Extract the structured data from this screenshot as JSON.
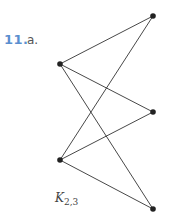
{
  "problem": {
    "number": "11.",
    "part": "a.",
    "number_color": "#5b8fcf"
  },
  "graph": {
    "name": "K",
    "subscript": "2,3",
    "left_nodes": [
      {
        "id": "L1",
        "x": 60,
        "y": 64
      },
      {
        "id": "L2",
        "x": 60,
        "y": 160
      }
    ],
    "right_nodes": [
      {
        "id": "R1",
        "x": 153,
        "y": 16
      },
      {
        "id": "R2",
        "x": 153,
        "y": 112
      },
      {
        "id": "R3",
        "x": 153,
        "y": 209
      }
    ],
    "edges": [
      [
        "L1",
        "R1"
      ],
      [
        "L1",
        "R2"
      ],
      [
        "L1",
        "R3"
      ],
      [
        "L2",
        "R1"
      ],
      [
        "L2",
        "R2"
      ],
      [
        "L2",
        "R3"
      ]
    ]
  }
}
